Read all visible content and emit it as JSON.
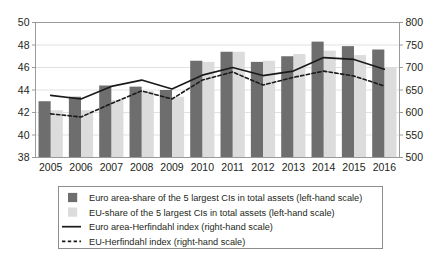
{
  "chart_data": {
    "type": "bar",
    "title": "",
    "subtitle": "",
    "xlabel": "",
    "ylabel": "",
    "grid": true,
    "legend_position": "bottom",
    "categories": [
      "2005",
      "2006",
      "2007",
      "2008",
      "2009",
      "2010",
      "2011",
      "2012",
      "2013",
      "2014",
      "2015",
      "2016"
    ],
    "left_axis": {
      "label": "",
      "min": 38,
      "max": 50,
      "step": 2,
      "ticks": [
        "38",
        "40",
        "42",
        "44",
        "46",
        "48",
        "50"
      ]
    },
    "right_axis": {
      "label": "",
      "min": 500,
      "max": 800,
      "step": 50,
      "ticks": [
        "500",
        "550",
        "600",
        "650",
        "700",
        "750",
        "800"
      ]
    },
    "series": [
      {
        "name": "Euro area-share of the 5 largest CIs in total assets (left-hand scale)",
        "type": "bar",
        "axis": "left",
        "color": "#6e6e6e",
        "values": [
          43.0,
          43.4,
          44.4,
          44.3,
          44.0,
          46.6,
          47.4,
          46.5,
          47.0,
          48.3,
          47.9,
          47.6
        ]
      },
      {
        "name": "EU-share of the 5 largest CIs in total assets (left-hand scale)",
        "type": "bar",
        "axis": "left",
        "color": "#dcdcdc",
        "values": [
          42.2,
          42.2,
          43.1,
          43.9,
          43.4,
          46.5,
          47.4,
          46.6,
          47.2,
          47.5,
          47.1,
          46.0
        ]
      },
      {
        "name": "Euro area-Herfindahl index (right-hand scale)",
        "type": "line",
        "axis": "right",
        "color": "#1a1a1a",
        "dash": "solid",
        "values": [
          638,
          630,
          658,
          672,
          652,
          683,
          700,
          682,
          692,
          722,
          718,
          696
        ]
      },
      {
        "name": "EU-Herfindahl index (right-hand scale)",
        "type": "line",
        "axis": "right",
        "color": "#1a1a1a",
        "dash": "dashed",
        "values": [
          597,
          590,
          620,
          648,
          630,
          672,
          690,
          661,
          678,
          692,
          681,
          659
        ]
      }
    ]
  },
  "legend": {
    "items": [
      {
        "marker": "dark-square-swatch",
        "label": "Euro area-share of the 5 largest CIs in total assets (left-hand scale)"
      },
      {
        "marker": "light-square-swatch",
        "label": "EU-share of the 5 largest CIs in total assets (left-hand scale)"
      },
      {
        "marker": "solid-line-swatch",
        "label": "Euro area-Herfindahl index (right-hand scale)"
      },
      {
        "marker": "dashed-line-swatch",
        "label": "EU-Herfindahl index (right-hand scale)"
      }
    ]
  },
  "colors": {
    "bar_dark": "#6e6e6e",
    "bar_light": "#dcdcdc",
    "line": "#1a1a1a",
    "grid": "#d9d9d9",
    "frame": "#9a9a9a",
    "text": "#231f20",
    "background": "#ffffff"
  }
}
